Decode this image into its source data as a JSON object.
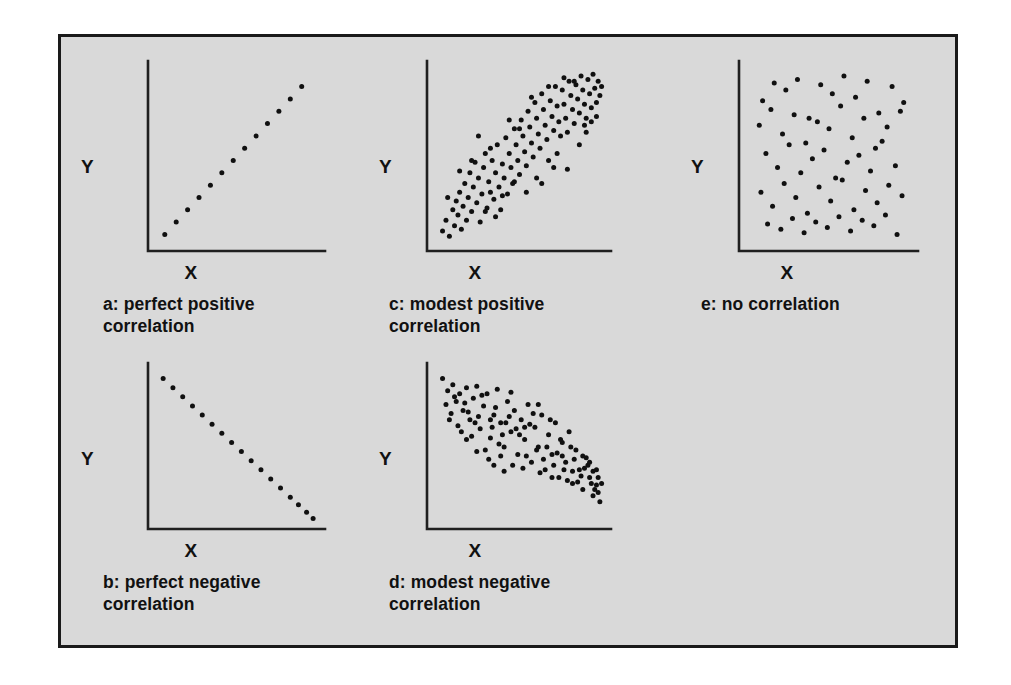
{
  "figure": {
    "background_color": "#d9d9d9",
    "border_color": "#1a1a1a",
    "point_color": "#101010",
    "axis_color": "#1f1f1f",
    "axis_label_x": "X",
    "axis_label_y": "Y"
  },
  "panels": [
    {
      "key": "a",
      "caption": "a: perfect positive\n   correlation",
      "xlabel": "X",
      "ylabel": "Y"
    },
    {
      "key": "c",
      "caption": "c: modest positive\n   correlation",
      "xlabel": "X",
      "ylabel": "Y"
    },
    {
      "key": "e",
      "caption": "e: no correlation",
      "xlabel": "X",
      "ylabel": "Y"
    },
    {
      "key": "b",
      "caption": "b: perfect negative\n   correlation",
      "xlabel": "X",
      "ylabel": "Y"
    },
    {
      "key": "d",
      "caption": "d: modest negative\n   correlation",
      "xlabel": "X",
      "ylabel": "Y"
    }
  ],
  "chart_data": [
    {
      "id": "a",
      "type": "scatter",
      "title": "a: perfect positive correlation",
      "xlabel": "X",
      "ylabel": "Y",
      "xlim": [
        0,
        100
      ],
      "ylim": [
        0,
        100
      ],
      "grid": false,
      "legend": "none",
      "n_points": 13,
      "points": [
        [
          6,
          6
        ],
        [
          13,
          13
        ],
        [
          20,
          20
        ],
        [
          27,
          27
        ],
        [
          34,
          34
        ],
        [
          41,
          41
        ],
        [
          48,
          48
        ],
        [
          55,
          55
        ],
        [
          62,
          62
        ],
        [
          69,
          69
        ],
        [
          76,
          76
        ],
        [
          83,
          83
        ],
        [
          90,
          90
        ]
      ]
    },
    {
      "id": "c",
      "type": "scatter",
      "title": "c: modest positive correlation",
      "xlabel": "X",
      "ylabel": "Y",
      "xlim": [
        0,
        100
      ],
      "ylim": [
        0,
        100
      ],
      "grid": false,
      "legend": "none",
      "n_points": 116,
      "points": [
        [
          5,
          8
        ],
        [
          7,
          14
        ],
        [
          9,
          5
        ],
        [
          11,
          20
        ],
        [
          12,
          11
        ],
        [
          13,
          25
        ],
        [
          14,
          17
        ],
        [
          15,
          30
        ],
        [
          16,
          9
        ],
        [
          17,
          22
        ],
        [
          18,
          35
        ],
        [
          19,
          14
        ],
        [
          20,
          27
        ],
        [
          21,
          41
        ],
        [
          22,
          19
        ],
        [
          23,
          33
        ],
        [
          24,
          47
        ],
        [
          25,
          24
        ],
        [
          26,
          38
        ],
        [
          27,
          13
        ],
        [
          28,
          29
        ],
        [
          29,
          44
        ],
        [
          30,
          52
        ],
        [
          31,
          21
        ],
        [
          32,
          36
        ],
        [
          33,
          30
        ],
        [
          34,
          48
        ],
        [
          35,
          26
        ],
        [
          36,
          41
        ],
        [
          37,
          57
        ],
        [
          38,
          33
        ],
        [
          39,
          20
        ],
        [
          40,
          46
        ],
        [
          41,
          38
        ],
        [
          42,
          61
        ],
        [
          43,
          29
        ],
        [
          44,
          52
        ],
        [
          45,
          44
        ],
        [
          46,
          35
        ],
        [
          47,
          66
        ],
        [
          48,
          57
        ],
        [
          49,
          48
        ],
        [
          50,
          40
        ],
        [
          51,
          71
        ],
        [
          52,
          62
        ],
        [
          53,
          53
        ],
        [
          54,
          45
        ],
        [
          55,
          76
        ],
        [
          56,
          67
        ],
        [
          57,
          58
        ],
        [
          58,
          50
        ],
        [
          59,
          81
        ],
        [
          60,
          72
        ],
        [
          61,
          63
        ],
        [
          62,
          55
        ],
        [
          63,
          86
        ],
        [
          64,
          77
        ],
        [
          65,
          68
        ],
        [
          66,
          60
        ],
        [
          67,
          48
        ],
        [
          68,
          82
        ],
        [
          69,
          73
        ],
        [
          70,
          65
        ],
        [
          71,
          90
        ],
        [
          72,
          79
        ],
        [
          73,
          70
        ],
        [
          74,
          62
        ],
        [
          75,
          88
        ],
        [
          76,
          80
        ],
        [
          77,
          72
        ],
        [
          78,
          64
        ],
        [
          79,
          93
        ],
        [
          80,
          85
        ],
        [
          81,
          77
        ],
        [
          82,
          69
        ],
        [
          83,
          91
        ],
        [
          84,
          83
        ],
        [
          85,
          75
        ],
        [
          86,
          96
        ],
        [
          87,
          88
        ],
        [
          88,
          80
        ],
        [
          89,
          72
        ],
        [
          90,
          94
        ],
        [
          91,
          86
        ],
        [
          92,
          78
        ],
        [
          93,
          97
        ],
        [
          94,
          89
        ],
        [
          95,
          81
        ],
        [
          96,
          93
        ],
        [
          97,
          85
        ],
        [
          98,
          90
        ],
        [
          26,
          62
        ],
        [
          33,
          55
        ],
        [
          40,
          28
        ],
        [
          47,
          36
        ],
        [
          54,
          30
        ],
        [
          60,
          38
        ],
        [
          67,
          90
        ],
        [
          72,
          52
        ],
        [
          78,
          43
        ],
        [
          85,
          57
        ],
        [
          88,
          68
        ],
        [
          92,
          70
        ],
        [
          44,
          71
        ],
        [
          50,
          66
        ],
        [
          57,
          84
        ],
        [
          63,
          35
        ],
        [
          70,
          44
        ],
        [
          76,
          95
        ],
        [
          82,
          93
        ],
        [
          89,
          64
        ],
        [
          95,
          73
        ],
        [
          8,
          27
        ],
        [
          15,
          42
        ],
        [
          22,
          48
        ],
        [
          30,
          19
        ],
        [
          36,
          16
        ]
      ]
    },
    {
      "id": "e",
      "type": "scatter",
      "title": "e: no correlation",
      "xlabel": "X",
      "ylabel": "Y",
      "xlim": [
        0,
        100
      ],
      "ylim": [
        0,
        100
      ],
      "grid": false,
      "legend": "none",
      "n_points": 62,
      "points": [
        [
          10,
          82
        ],
        [
          17,
          92
        ],
        [
          24,
          88
        ],
        [
          31,
          94
        ],
        [
          38,
          72
        ],
        [
          45,
          91
        ],
        [
          52,
          86
        ],
        [
          59,
          96
        ],
        [
          66,
          84
        ],
        [
          73,
          93
        ],
        [
          80,
          75
        ],
        [
          88,
          90
        ],
        [
          95,
          81
        ],
        [
          8,
          68
        ],
        [
          15,
          77
        ],
        [
          22,
          63
        ],
        [
          29,
          74
        ],
        [
          36,
          58
        ],
        [
          43,
          70
        ],
        [
          50,
          66
        ],
        [
          57,
          79
        ],
        [
          64,
          61
        ],
        [
          71,
          72
        ],
        [
          78,
          55
        ],
        [
          85,
          67
        ],
        [
          93,
          76
        ],
        [
          12,
          52
        ],
        [
          19,
          44
        ],
        [
          26,
          57
        ],
        [
          33,
          41
        ],
        [
          40,
          49
        ],
        [
          47,
          54
        ],
        [
          54,
          38
        ],
        [
          61,
          47
        ],
        [
          68,
          51
        ],
        [
          75,
          42
        ],
        [
          82,
          59
        ],
        [
          90,
          45
        ],
        [
          9,
          30
        ],
        [
          16,
          22
        ],
        [
          23,
          35
        ],
        [
          30,
          27
        ],
        [
          37,
          18
        ],
        [
          44,
          33
        ],
        [
          51,
          25
        ],
        [
          58,
          37
        ],
        [
          65,
          20
        ],
        [
          72,
          31
        ],
        [
          79,
          24
        ],
        [
          86,
          34
        ],
        [
          94,
          28
        ],
        [
          13,
          12
        ],
        [
          21,
          9
        ],
        [
          28,
          15
        ],
        [
          35,
          7
        ],
        [
          42,
          13
        ],
        [
          49,
          10
        ],
        [
          56,
          16
        ],
        [
          63,
          8
        ],
        [
          70,
          14
        ],
        [
          77,
          11
        ],
        [
          84,
          17
        ],
        [
          91,
          6
        ]
      ]
    },
    {
      "id": "b",
      "type": "scatter",
      "title": "b: perfect negative correlation",
      "xlabel": "X",
      "ylabel": "Y",
      "xlim": [
        0,
        100
      ],
      "ylim": [
        0,
        100
      ],
      "grid": false,
      "legend": "none",
      "n_points": 17,
      "points": [
        [
          5,
          95
        ],
        [
          11,
          89
        ],
        [
          17,
          83
        ],
        [
          23,
          77
        ],
        [
          29,
          71
        ],
        [
          35,
          65
        ],
        [
          41,
          59
        ],
        [
          47,
          53
        ],
        [
          53,
          47
        ],
        [
          59,
          41
        ],
        [
          65,
          35
        ],
        [
          71,
          29
        ],
        [
          77,
          23
        ],
        [
          83,
          17
        ],
        [
          88,
          12
        ],
        [
          93,
          7
        ],
        [
          97,
          3
        ]
      ]
    },
    {
      "id": "d",
      "type": "scatter",
      "title": "d: modest negative correlation",
      "xlabel": "X",
      "ylabel": "Y",
      "xlim": [
        0,
        100
      ],
      "ylim": [
        0,
        100
      ],
      "grid": false,
      "legend": "none",
      "n_points": 108,
      "points": [
        [
          5,
          95
        ],
        [
          8,
          87
        ],
        [
          11,
          91
        ],
        [
          13,
          80
        ],
        [
          15,
          85
        ],
        [
          17,
          74
        ],
        [
          19,
          89
        ],
        [
          21,
          68
        ],
        [
          23,
          82
        ],
        [
          25,
          90
        ],
        [
          27,
          62
        ],
        [
          29,
          77
        ],
        [
          31,
          85
        ],
        [
          33,
          56
        ],
        [
          35,
          71
        ],
        [
          37,
          88
        ],
        [
          39,
          66
        ],
        [
          41,
          50
        ],
        [
          43,
          80
        ],
        [
          45,
          60
        ],
        [
          47,
          74
        ],
        [
          49,
          45
        ],
        [
          51,
          68
        ],
        [
          53,
          55
        ],
        [
          55,
          78
        ],
        [
          57,
          40
        ],
        [
          59,
          63
        ],
        [
          61,
          50
        ],
        [
          63,
          71
        ],
        [
          65,
          35
        ],
        [
          67,
          58
        ],
        [
          69,
          45
        ],
        [
          71,
          66
        ],
        [
          73,
          30
        ],
        [
          75,
          53
        ],
        [
          77,
          40
        ],
        [
          79,
          60
        ],
        [
          81,
          26
        ],
        [
          83,
          48
        ],
        [
          85,
          35
        ],
        [
          87,
          22
        ],
        [
          89,
          43
        ],
        [
          91,
          30
        ],
        [
          93,
          18
        ],
        [
          95,
          25
        ],
        [
          97,
          14
        ],
        [
          10,
          72
        ],
        [
          14,
          64
        ],
        [
          18,
          79
        ],
        [
          22,
          57
        ],
        [
          26,
          70
        ],
        [
          30,
          48
        ],
        [
          34,
          63
        ],
        [
          38,
          52
        ],
        [
          42,
          66
        ],
        [
          46,
          38
        ],
        [
          50,
          58
        ],
        [
          54,
          44
        ],
        [
          58,
          72
        ],
        [
          62,
          33
        ],
        [
          66,
          50
        ],
        [
          70,
          38
        ],
        [
          74,
          55
        ],
        [
          78,
          28
        ],
        [
          82,
          42
        ],
        [
          86,
          31
        ],
        [
          90,
          38
        ],
        [
          94,
          22
        ],
        [
          96,
          30
        ],
        [
          7,
          78
        ],
        [
          12,
          83
        ],
        [
          16,
          60
        ],
        [
          20,
          73
        ],
        [
          24,
          66
        ],
        [
          28,
          84
        ],
        [
          32,
          42
        ],
        [
          36,
          76
        ],
        [
          40,
          58
        ],
        [
          44,
          70
        ],
        [
          48,
          62
        ],
        [
          52,
          36
        ],
        [
          56,
          65
        ],
        [
          60,
          48
        ],
        [
          64,
          42
        ],
        [
          68,
          68
        ],
        [
          72,
          46
        ],
        [
          76,
          35
        ],
        [
          80,
          50
        ],
        [
          84,
          27
        ],
        [
          88,
          36
        ],
        [
          92,
          26
        ],
        [
          95,
          35
        ],
        [
          9,
          68
        ],
        [
          19,
          55
        ],
        [
          25,
          47
        ],
        [
          33,
          68
        ],
        [
          39,
          44
        ],
        [
          45,
          86
        ],
        [
          53,
          63
        ],
        [
          61,
          78
        ],
        [
          69,
          30
        ],
        [
          75,
          44
        ],
        [
          81,
          34
        ],
        [
          87,
          44
        ],
        [
          91,
          40
        ],
        [
          93,
          34
        ],
        [
          96,
          20
        ],
        [
          98,
          26
        ],
        [
          35,
          38
        ],
        [
          41,
          34
        ]
      ]
    }
  ]
}
